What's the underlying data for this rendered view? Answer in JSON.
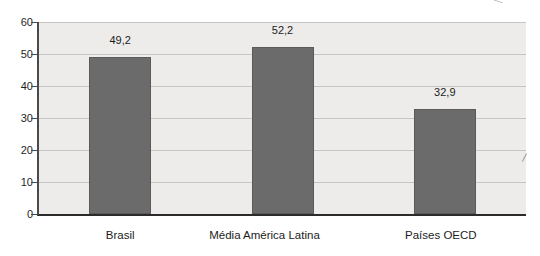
{
  "chart_data": {
    "type": "bar",
    "categories": [
      "Brasil",
      "Média América Latina",
      "Países OECD"
    ],
    "values": [
      49.2,
      52.2,
      32.9
    ],
    "value_labels": [
      "49,2",
      "52,2",
      "32,9"
    ],
    "xlabel": "",
    "ylabel": "",
    "ylim": [
      0,
      60
    ],
    "ytick_step": 10,
    "ytick_labels": [
      "0",
      "10",
      "20",
      "30",
      "40",
      "50",
      "60"
    ],
    "grid": true,
    "legend": "none",
    "bar_color": "#6b6b6b",
    "bar_border_color": "#5a5a5a",
    "plot_bg_color": "#edeceb",
    "gridline_color": "#c7c6c3",
    "axis_color": "#2b2b2b",
    "text_color": "#1c1c1c",
    "category_label_dx": [
      0,
      -18,
      -4
    ]
  }
}
